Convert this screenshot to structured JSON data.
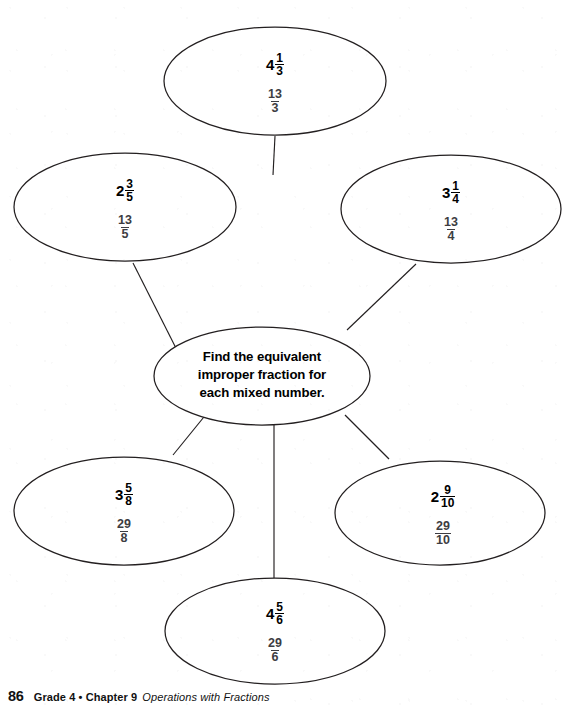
{
  "page": {
    "background_color": "#ffffff",
    "ink_color": "#231f20",
    "answer_color": "#3d3d42"
  },
  "center": {
    "prompt_line_1": "Find the equivalent",
    "prompt_line_2": "improper fraction for",
    "prompt_line_3": "each mixed number."
  },
  "nodes": [
    {
      "id": "top",
      "position": "top",
      "mixed_whole": "4",
      "mixed_numerator": "1",
      "mixed_denominator": "3",
      "answer_numerator": "13",
      "answer_denominator": "3"
    },
    {
      "id": "upper-left",
      "position": "upper-left",
      "mixed_whole": "2",
      "mixed_numerator": "3",
      "mixed_denominator": "5",
      "answer_numerator": "13",
      "answer_denominator": "5"
    },
    {
      "id": "upper-right",
      "position": "upper-right",
      "mixed_whole": "3",
      "mixed_numerator": "1",
      "mixed_denominator": "4",
      "answer_numerator": "13",
      "answer_denominator": "4"
    },
    {
      "id": "lower-left",
      "position": "lower-left",
      "mixed_whole": "3",
      "mixed_numerator": "5",
      "mixed_denominator": "8",
      "answer_numerator": "29",
      "answer_denominator": "8"
    },
    {
      "id": "lower-right",
      "position": "lower-right",
      "mixed_whole": "2",
      "mixed_numerator": "9",
      "mixed_denominator": "10",
      "answer_numerator": "29",
      "answer_denominator": "10"
    },
    {
      "id": "bottom",
      "position": "bottom",
      "mixed_whole": "4",
      "mixed_numerator": "5",
      "mixed_denominator": "6",
      "answer_numerator": "29",
      "answer_denominator": "6"
    }
  ],
  "footer": {
    "page_number": "86",
    "grade_chapter": "Grade 4 • Chapter 9",
    "subject": "Operations with Fractions"
  }
}
